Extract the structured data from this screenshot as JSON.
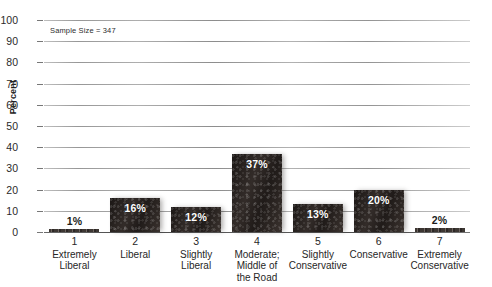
{
  "chart_data": {
    "type": "bar",
    "title": "",
    "xlabel": "",
    "ylabel": "Percent",
    "ylim": [
      0,
      100
    ],
    "ytick_step": 10,
    "yticks": [
      "100",
      "90",
      "80",
      "70",
      "60",
      "50",
      "40",
      "30",
      "20",
      "10",
      "0"
    ],
    "grid": true,
    "legend": "none",
    "annotation": "Sample Size = 347",
    "sample_size": 347,
    "categories": [
      "Extremely Liberal",
      "Liberal",
      "Slightly Liberal",
      "Moderate; Middle of the Road",
      "Slightly Conservative",
      "Conservative",
      "Extremely Conservative"
    ],
    "values": [
      1,
      16,
      12,
      37,
      13,
      20,
      2
    ],
    "value_labels": [
      "1%",
      "16%",
      "12%",
      "37%",
      "13%",
      "20%",
      "2%"
    ],
    "bar_color": "#26211f",
    "bars": [
      {
        "num": "1",
        "cat_line1": "Extremely",
        "cat_line2": "Liberal",
        "cat_line3": "",
        "value": 1,
        "label": "1%",
        "label_pos": "above"
      },
      {
        "num": "2",
        "cat_line1": "Liberal",
        "cat_line2": "",
        "cat_line3": "",
        "value": 16,
        "label": "16%",
        "label_pos": "inside"
      },
      {
        "num": "3",
        "cat_line1": "Slightly",
        "cat_line2": "Liberal",
        "cat_line3": "",
        "value": 12,
        "label": "12%",
        "label_pos": "inside"
      },
      {
        "num": "4",
        "cat_line1": "Moderate;",
        "cat_line2": "Middle of",
        "cat_line3": "the Road",
        "value": 37,
        "label": "37%",
        "label_pos": "inside"
      },
      {
        "num": "5",
        "cat_line1": "Slightly",
        "cat_line2": "Conservative",
        "cat_line3": "",
        "value": 13,
        "label": "13%",
        "label_pos": "inside"
      },
      {
        "num": "6",
        "cat_line1": "Conservative",
        "cat_line2": "",
        "cat_line3": "",
        "value": 20,
        "label": "20%",
        "label_pos": "inside"
      },
      {
        "num": "7",
        "cat_line1": "Extremely",
        "cat_line2": "Conservative",
        "cat_line3": "",
        "value": 2,
        "label": "2%",
        "label_pos": "above"
      }
    ]
  }
}
